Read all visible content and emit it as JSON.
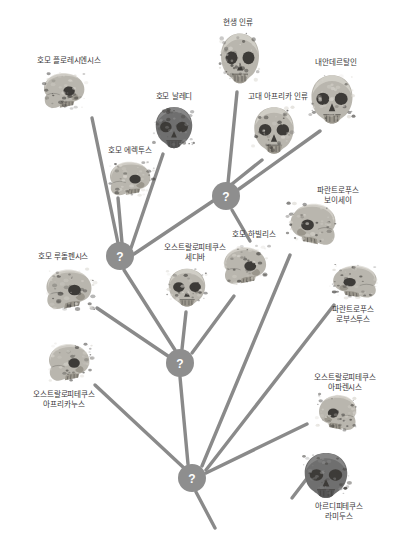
{
  "diagram": {
    "background_color": "#ffffff",
    "branch_color": "#8a8a8a",
    "node_color": "#8e8e8e",
    "label_color": "#3a3a3a",
    "node_symbol": "?"
  },
  "taxa": [
    {
      "id": "floresiensis",
      "label": "호모 플로레시엔시스",
      "label_x": 25,
      "label_y": 56,
      "label_w": 88,
      "skull_x": 40,
      "skull_y": 69,
      "skull_w": 52,
      "skull_h": 46,
      "variant": "profile-left"
    },
    {
      "id": "erectus",
      "label": "호모 에렉투스",
      "label_x": 95,
      "label_y": 146,
      "label_w": 70,
      "skull_x": 106,
      "skull_y": 158,
      "skull_w": 52,
      "skull_h": 44,
      "variant": "profile-left"
    },
    {
      "id": "naledi",
      "label": "호모 날레디",
      "label_x": 140,
      "label_y": 92,
      "label_w": 68,
      "skull_x": 150,
      "skull_y": 104,
      "skull_w": 48,
      "skull_h": 48,
      "variant": "front-dark"
    },
    {
      "id": "modern_human",
      "label": "현생 인류",
      "label_x": 207,
      "label_y": 18,
      "label_w": 62,
      "skull_x": 215,
      "skull_y": 30,
      "skull_w": 50,
      "skull_h": 58,
      "variant": "front"
    },
    {
      "id": "archaic_african",
      "label": "고대 아프리카 인류",
      "label_x": 233,
      "label_y": 92,
      "label_w": 90,
      "skull_x": 248,
      "skull_y": 104,
      "skull_w": 52,
      "skull_h": 54,
      "variant": "front"
    },
    {
      "id": "neanderthal",
      "label": "내안데르탈인",
      "label_x": 297,
      "label_y": 58,
      "label_w": 78,
      "skull_x": 305,
      "skull_y": 72,
      "skull_w": 54,
      "skull_h": 56,
      "variant": "front"
    },
    {
      "id": "sediba",
      "label": "오스트랄로피테쿠스\n세디바",
      "label_x": 143,
      "label_y": 243,
      "label_w": 104,
      "skull_x": 163,
      "skull_y": 266,
      "skull_w": 48,
      "skull_h": 44,
      "variant": "front"
    },
    {
      "id": "habilis",
      "label": "호모 하빌리스",
      "label_x": 218,
      "label_y": 230,
      "label_w": 72,
      "skull_x": 220,
      "skull_y": 243,
      "skull_w": 54,
      "skull_h": 48,
      "variant": "profile-left"
    },
    {
      "id": "boisei",
      "label": "파란트로푸스\n보이세이",
      "label_x": 297,
      "label_y": 186,
      "label_w": 82,
      "skull_x": 282,
      "skull_y": 199,
      "skull_w": 58,
      "skull_h": 54,
      "variant": "profile-right"
    },
    {
      "id": "robustus",
      "label": "파란트로푸스\n로부스투스",
      "label_x": 312,
      "label_y": 305,
      "label_w": 82,
      "skull_x": 325,
      "skull_y": 262,
      "skull_w": 56,
      "skull_h": 42,
      "variant": "profile-right"
    },
    {
      "id": "rudolfensis",
      "label": "호모 루돌펜시스",
      "label_x": 22,
      "label_y": 252,
      "label_w": 82,
      "skull_x": 42,
      "skull_y": 265,
      "skull_w": 58,
      "skull_h": 52,
      "variant": "profile-left"
    },
    {
      "id": "africanus",
      "label": "오스트랄로피테쿠스\n아프리카누스",
      "label_x": 12,
      "label_y": 390,
      "label_w": 104,
      "skull_x": 45,
      "skull_y": 340,
      "skull_w": 52,
      "skull_h": 48,
      "variant": "profile-left"
    },
    {
      "id": "afarensis",
      "label": "오스트랄로피테쿠스\n아파렌시스",
      "label_x": 293,
      "label_y": 373,
      "label_w": 104,
      "skull_x": 312,
      "skull_y": 391,
      "skull_w": 48,
      "skull_h": 46,
      "variant": "profile-right"
    },
    {
      "id": "ramidus",
      "label": "아르디피테쿠스\n라미두스",
      "label_x": 294,
      "label_y": 502,
      "label_w": 90,
      "skull_x": 298,
      "skull_y": 450,
      "skull_w": 56,
      "skull_h": 52,
      "variant": "front-dark"
    }
  ],
  "nodes": [
    {
      "id": "node-upper",
      "x": 226,
      "y": 196,
      "r": 14
    },
    {
      "id": "node-left",
      "x": 120,
      "y": 256,
      "r": 14
    },
    {
      "id": "node-middle",
      "x": 180,
      "y": 363,
      "r": 14
    },
    {
      "id": "node-root",
      "x": 192,
      "y": 478,
      "r": 14
    }
  ],
  "branches": [
    {
      "id": "floresiensis-to-node-left",
      "x1": 92,
      "y1": 118,
      "x2": 118,
      "y2": 243
    },
    {
      "id": "erectus-to-node-left",
      "x1": 118,
      "y1": 198,
      "x2": 122,
      "y2": 243
    },
    {
      "id": "naledi-to-node-left",
      "x1": 163,
      "y1": 154,
      "x2": 131,
      "y2": 248
    },
    {
      "id": "modern-to-node-upper",
      "x1": 237,
      "y1": 92,
      "x2": 228,
      "y2": 183
    },
    {
      "id": "archaic-to-node-upper",
      "x1": 262,
      "y1": 160,
      "x2": 232,
      "y2": 184
    },
    {
      "id": "neanderthal-to-node-upper",
      "x1": 320,
      "y1": 131,
      "x2": 239,
      "y2": 189
    },
    {
      "id": "nodeupper-to-nodeleft",
      "x1": 213,
      "y1": 201,
      "x2": 134,
      "y2": 254
    },
    {
      "id": "habilis-to-node-upper",
      "x1": 250,
      "y1": 241,
      "x2": 232,
      "y2": 210
    },
    {
      "id": "sediba-to-node-middle",
      "x1": 186,
      "y1": 312,
      "x2": 182,
      "y2": 349
    },
    {
      "id": "nodeleft-to-nodemiddle",
      "x1": 124,
      "y1": 270,
      "x2": 175,
      "y2": 350
    },
    {
      "id": "rudolfensis-to-nodemiddle",
      "x1": 97,
      "y1": 308,
      "x2": 168,
      "y2": 356
    },
    {
      "id": "habilis-to-node-middle",
      "x1": 234,
      "y1": 296,
      "x2": 192,
      "y2": 353
    },
    {
      "id": "africanus-to-node-root",
      "x1": 95,
      "y1": 385,
      "x2": 184,
      "y2": 468
    },
    {
      "id": "nodemiddle-to-noderoot",
      "x1": 180,
      "y1": 377,
      "x2": 188,
      "y2": 464
    },
    {
      "id": "boisei-to-node-root",
      "x1": 290,
      "y1": 255,
      "x2": 202,
      "y2": 466
    },
    {
      "id": "robustus-to-node-root",
      "x1": 334,
      "y1": 305,
      "x2": 206,
      "y2": 470
    },
    {
      "id": "afarensis-to-node-root",
      "x1": 307,
      "y1": 424,
      "x2": 206,
      "y2": 473
    },
    {
      "id": "root-stem",
      "x1": 196,
      "y1": 492,
      "x2": 215,
      "y2": 528
    },
    {
      "id": "ramidus-stem",
      "x1": 292,
      "y1": 498,
      "x2": 318,
      "y2": 464
    }
  ]
}
